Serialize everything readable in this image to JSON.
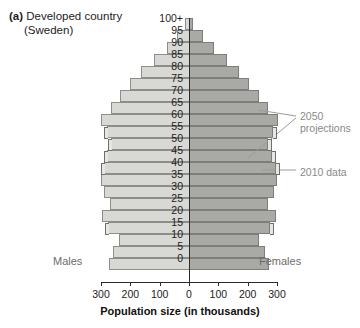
{
  "figure": {
    "panel_tag": "(a)",
    "title_line1": "Developed country",
    "title_line2": "(Sweden)",
    "left_label": "Males",
    "right_label": "Females",
    "annotation_projections": "2050 projections",
    "annotation_data": "2010 data",
    "colors": {
      "male_fill": "#d8d8d4",
      "female_fill": "#a9a9a6",
      "axis": "#2b2b2b",
      "annotation_text": "#8a8a8a"
    }
  },
  "chart_data": {
    "type": "bar",
    "subtype": "population-pyramid",
    "title": "(a) Developed country (Sweden)",
    "xlabel": "Population size (in thousands)",
    "ylabel": "",
    "xticks": [
      300,
      200,
      100,
      0,
      100,
      200,
      300
    ],
    "xtick_labels": [
      "300",
      "200",
      "100",
      "0",
      "100",
      "200",
      "300"
    ],
    "xlim": [
      -300,
      300
    ],
    "grid": false,
    "legend_position": "annotations-right",
    "categories": [
      "0",
      "5",
      "10",
      "15",
      "20",
      "25",
      "30",
      "35",
      "40",
      "45",
      "50",
      "55",
      "60",
      "65",
      "70",
      "75",
      "80",
      "85",
      "90",
      "95",
      "100+"
    ],
    "series": [
      {
        "name": "Males",
        "side": "left",
        "values": [
          272,
          258,
          240,
          275,
          295,
          270,
          290,
          300,
          290,
          280,
          265,
          280,
          300,
          265,
          235,
          200,
          165,
          120,
          75,
          40,
          12
        ]
      },
      {
        "name": "Females",
        "side": "right",
        "values": [
          272,
          258,
          240,
          275,
          295,
          270,
          290,
          300,
          295,
          282,
          270,
          285,
          305,
          268,
          240,
          205,
          170,
          128,
          85,
          48,
          15
        ]
      }
    ],
    "projection_markers": {
      "label": "2050 projections",
      "ages": [
        "15",
        "40",
        "45",
        "50",
        "55"
      ]
    },
    "data_marker": {
      "label": "2010 data",
      "age": "40"
    }
  }
}
